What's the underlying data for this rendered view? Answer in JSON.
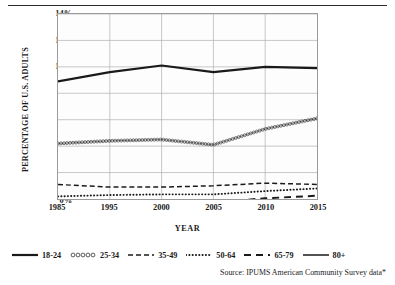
{
  "chart_data": {
    "type": "line",
    "title": "",
    "xlabel": "YEAR",
    "ylabel": "PERCENTAGE OF U.S. ADULTS",
    "x": [
      1985,
      1995,
      2000,
      2005,
      2010,
      2015
    ],
    "xtick_labels": [
      "1985",
      "1995",
      "2000",
      "2005",
      "2010",
      "2015"
    ],
    "ytick_labels": [
      "0%",
      "2%",
      "4%",
      "6%",
      "8%",
      "10%",
      "12%",
      "14%"
    ],
    "ytick_values": [
      0,
      2,
      4,
      6,
      8,
      10,
      12,
      14
    ],
    "ylim": [
      0,
      14
    ],
    "grid": true,
    "legend_position": "below",
    "series": [
      {
        "name": "18-24",
        "style": "solid-thick",
        "values": [
          8.9,
          9.6,
          10.1,
          9.6,
          10.0,
          9.9
        ]
      },
      {
        "name": "25-34",
        "style": "circles",
        "values": [
          4.2,
          4.4,
          4.5,
          4.1,
          5.3,
          6.1
        ]
      },
      {
        "name": "35-49",
        "style": "dashed",
        "values": [
          1.1,
          0.9,
          0.9,
          1.0,
          1.2,
          1.1
        ]
      },
      {
        "name": "50-64",
        "style": "dotted",
        "values": [
          0.2,
          0.3,
          0.35,
          0.35,
          0.6,
          0.8
        ]
      },
      {
        "name": "65-79",
        "style": "long-dash",
        "values": [
          -0.35,
          -0.3,
          -0.3,
          -0.25,
          0.05,
          0.25
        ]
      },
      {
        "name": "80+",
        "style": "solid-thin",
        "values": [
          -0.45,
          -0.45,
          -0.45,
          -0.4,
          -0.25,
          -0.1
        ]
      }
    ]
  },
  "legend": {
    "items": [
      {
        "label": "18-24"
      },
      {
        "label": "25-34"
      },
      {
        "label": "35-49"
      },
      {
        "label": "50-64"
      },
      {
        "label": "65-79"
      },
      {
        "label": "80+"
      }
    ]
  },
  "footer": {
    "source": "Source:  IPUMS American Community Survey data*"
  },
  "colors": {
    "line": "#1a1a1a",
    "grid": "#b0b0b0",
    "frame": "#9a9a9a",
    "text": "#1a1a1a"
  }
}
